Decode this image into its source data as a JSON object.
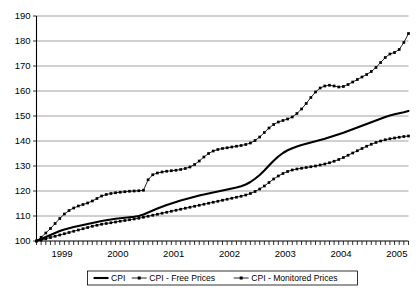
{
  "chart_data": {
    "type": "line",
    "title": "",
    "xlabel": "",
    "ylabel": "",
    "ylim": [
      100,
      190
    ],
    "yticks": [
      100,
      110,
      120,
      130,
      140,
      150,
      160,
      170,
      180,
      190
    ],
    "ytick_labels": [
      "100",
      "110",
      "120",
      "130",
      "140",
      "150",
      "160",
      "170",
      "180",
      "190"
    ],
    "grid": true,
    "grid_axis": "y",
    "legend_position": "bottom-center",
    "x_axis_type": "monthly",
    "x_tick_interval": "month",
    "xlim_labels": [
      "1999",
      "2005"
    ],
    "xtick_labels": [
      "1999",
      "2000",
      "2001",
      "2002",
      "2003",
      "2004",
      "2005"
    ],
    "x_year_starts": [
      0,
      12,
      24,
      36,
      48,
      60,
      72
    ],
    "n_points": 81,
    "x_index_start": 0,
    "base_value": 100,
    "base_period": "1999",
    "series": [
      {
        "name": "CPI",
        "style": "solid-thick",
        "marker": "none",
        "color": "#000000",
        "end_value": 152,
        "values": [
          100.0,
          100.8,
          101.6,
          102.4,
          103.2,
          104.0,
          104.6,
          105.1,
          105.6,
          106.0,
          106.4,
          106.8,
          107.2,
          107.6,
          108.0,
          108.3,
          108.6,
          108.9,
          109.1,
          109.3,
          109.5,
          109.7,
          110.0,
          110.6,
          111.4,
          112.2,
          113.0,
          113.7,
          114.4,
          115.0,
          115.6,
          116.2,
          116.7,
          117.2,
          117.7,
          118.2,
          118.6,
          119.0,
          119.4,
          119.8,
          120.2,
          120.6,
          121.0,
          121.4,
          121.9,
          122.6,
          123.6,
          124.9,
          126.4,
          128.2,
          130.2,
          132.1,
          133.8,
          135.2,
          136.3,
          137.1,
          137.8,
          138.4,
          138.9,
          139.4,
          139.9,
          140.4,
          140.9,
          141.5,
          142.1,
          142.7,
          143.3,
          144.0,
          144.7,
          145.4,
          146.1,
          146.8,
          147.5,
          148.2,
          148.9,
          149.6,
          150.2,
          150.7,
          151.1,
          151.5,
          152.0
        ]
      },
      {
        "name": "CPI - Free Prices",
        "style": "thin-marker",
        "marker": "square",
        "color": "#000000",
        "end_value": 183,
        "values": [
          100.0,
          101.5,
          103.2,
          105.0,
          107.0,
          109.0,
          110.8,
          112.2,
          113.2,
          114.0,
          114.6,
          115.2,
          116.0,
          117.0,
          118.0,
          118.6,
          119.0,
          119.3,
          119.5,
          119.7,
          119.9,
          120.0,
          120.1,
          120.3,
          124.5,
          126.5,
          127.2,
          127.6,
          127.9,
          128.1,
          128.3,
          128.6,
          129.0,
          129.6,
          130.6,
          132.0,
          133.6,
          135.0,
          136.0,
          136.6,
          137.0,
          137.3,
          137.6,
          137.9,
          138.2,
          138.6,
          139.2,
          140.2,
          141.6,
          143.4,
          145.2,
          146.6,
          147.6,
          148.2,
          148.8,
          149.6,
          151.0,
          152.8,
          155.0,
          157.4,
          159.6,
          161.2,
          162.0,
          162.3,
          162.0,
          161.6,
          161.8,
          162.6,
          163.6,
          164.6,
          165.6,
          166.6,
          167.8,
          169.4,
          171.4,
          173.4,
          174.8,
          175.4,
          176.6,
          179.4,
          183.0
        ]
      },
      {
        "name": "CPI - Monitored Prices",
        "style": "thin-marker",
        "marker": "square",
        "color": "#000000",
        "end_value": 142,
        "values": [
          100.0,
          100.4,
          100.9,
          101.4,
          101.9,
          102.4,
          102.9,
          103.4,
          103.9,
          104.4,
          104.9,
          105.4,
          105.9,
          106.3,
          106.7,
          107.0,
          107.3,
          107.6,
          107.9,
          108.2,
          108.5,
          108.8,
          109.1,
          109.5,
          109.9,
          110.3,
          110.7,
          111.1,
          111.5,
          111.9,
          112.3,
          112.7,
          113.1,
          113.5,
          113.9,
          114.3,
          114.7,
          115.1,
          115.5,
          115.9,
          116.3,
          116.7,
          117.1,
          117.5,
          117.9,
          118.4,
          119.0,
          119.8,
          120.8,
          122.0,
          123.4,
          124.8,
          126.0,
          127.0,
          127.8,
          128.4,
          128.8,
          129.1,
          129.4,
          129.7,
          130.0,
          130.4,
          130.8,
          131.3,
          131.9,
          132.6,
          133.4,
          134.3,
          135.2,
          136.1,
          137.0,
          137.9,
          138.7,
          139.4,
          140.0,
          140.5,
          140.9,
          141.2,
          141.5,
          141.8,
          142.0
        ]
      }
    ],
    "legend": [
      {
        "label": "CPI",
        "style": "solid-thick",
        "marker": "none"
      },
      {
        "label": "CPI - Free Prices",
        "style": "thin-marker",
        "marker": "square"
      },
      {
        "label": "CPI - Monitored Prices",
        "style": "thin-marker",
        "marker": "square"
      }
    ]
  }
}
